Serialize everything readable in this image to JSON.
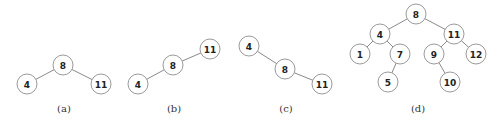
{
  "node_radius": 10,
  "trees": [
    {
      "caption": "(a)",
      "caption_pos": [
        64,
        108
      ],
      "nodes": [
        {
          "id": "a8",
          "label": "8",
          "x": 63,
          "y": 65
        },
        {
          "id": "a4",
          "label": "4",
          "x": 27,
          "y": 84
        },
        {
          "id": "a11",
          "label": "11",
          "x": 101,
          "y": 84
        }
      ],
      "edges": [
        [
          "a8",
          "a4"
        ],
        [
          "a8",
          "a11"
        ]
      ]
    },
    {
      "caption": "(b)",
      "caption_pos": [
        174,
        108
      ],
      "nodes": [
        {
          "id": "b11",
          "label": "11",
          "x": 210,
          "y": 49
        },
        {
          "id": "b8",
          "label": "8",
          "x": 173,
          "y": 65
        },
        {
          "id": "b4",
          "label": "4",
          "x": 138,
          "y": 84
        }
      ],
      "edges": [
        [
          "b11",
          "b8"
        ],
        [
          "b8",
          "b4"
        ]
      ]
    },
    {
      "caption": "(c)",
      "caption_pos": [
        286,
        108
      ],
      "nodes": [
        {
          "id": "c4",
          "label": "4",
          "x": 249,
          "y": 46
        },
        {
          "id": "c8",
          "label": "8",
          "x": 285,
          "y": 69
        },
        {
          "id": "c11",
          "label": "11",
          "x": 322,
          "y": 84
        }
      ],
      "edges": [
        [
          "c4",
          "c8"
        ],
        [
          "c8",
          "c11"
        ]
      ]
    },
    {
      "caption": "(d)",
      "caption_pos": [
        418,
        108
      ],
      "nodes": [
        {
          "id": "d8",
          "label": "8",
          "x": 416,
          "y": 14
        },
        {
          "id": "d4",
          "label": "4",
          "x": 380,
          "y": 34
        },
        {
          "id": "d11",
          "label": "11",
          "x": 454,
          "y": 34
        },
        {
          "id": "d1",
          "label": "1",
          "x": 360,
          "y": 54
        },
        {
          "id": "d7",
          "label": "7",
          "x": 400,
          "y": 54
        },
        {
          "id": "d9",
          "label": "9",
          "x": 434,
          "y": 54
        },
        {
          "id": "d12",
          "label": "12",
          "x": 476,
          "y": 54
        },
        {
          "id": "d5",
          "label": "5",
          "x": 388,
          "y": 82
        },
        {
          "id": "d10",
          "label": "10",
          "x": 450,
          "y": 82
        }
      ],
      "edges": [
        [
          "d8",
          "d4"
        ],
        [
          "d8",
          "d11"
        ],
        [
          "d4",
          "d1"
        ],
        [
          "d4",
          "d7"
        ],
        [
          "d7",
          "d5"
        ],
        [
          "d11",
          "d9"
        ],
        [
          "d11",
          "d12"
        ],
        [
          "d9",
          "d10"
        ]
      ]
    }
  ]
}
